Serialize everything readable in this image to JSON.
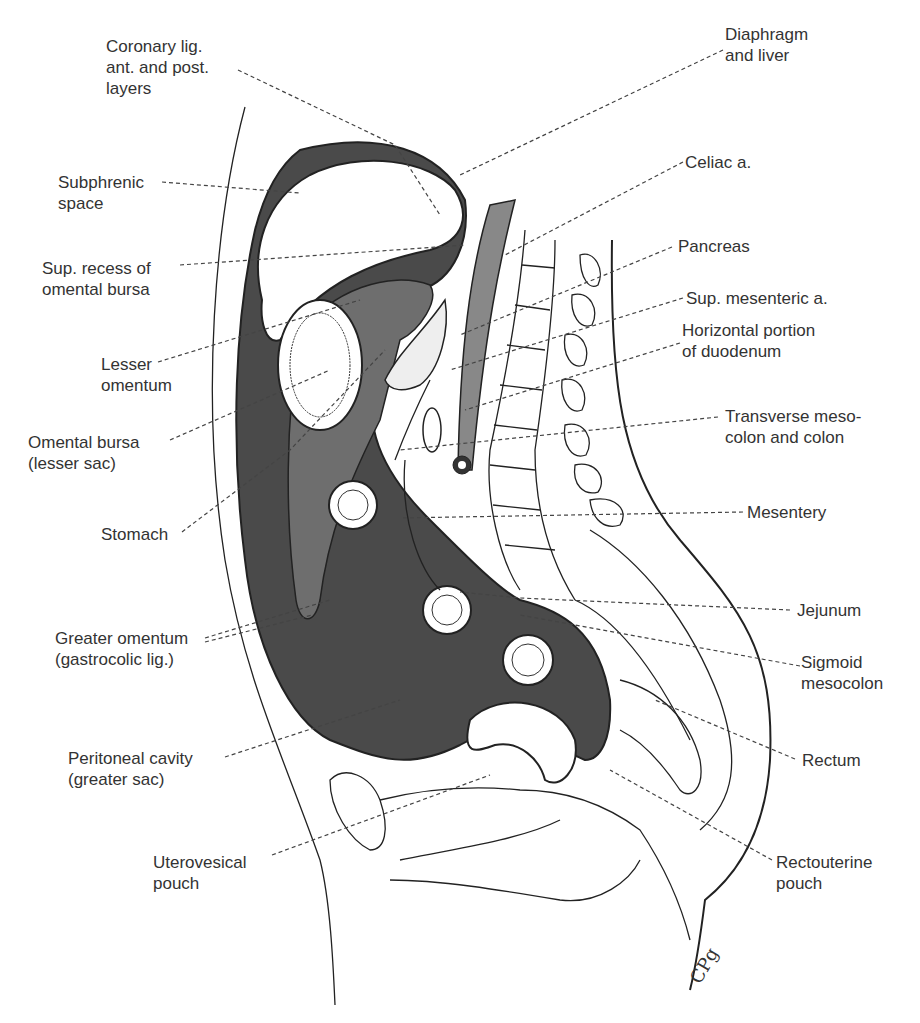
{
  "figure": {
    "signature": "CPg",
    "colors": {
      "peritoneal_cavity": "#4a4a4a",
      "omental_bursa": "#6e6e6e",
      "outline": "#222222",
      "background": "#ffffff"
    }
  },
  "labels": {
    "left": [
      {
        "id": "coronary-lig",
        "text": "Coronary lig.\nant. and post.\nlayers"
      },
      {
        "id": "subphrenic-space",
        "text": "Subphrenic\nspace"
      },
      {
        "id": "sup-recess",
        "text": "Sup. recess of\nomental bursa"
      },
      {
        "id": "lesser-omentum",
        "text": "Lesser\nomentum"
      },
      {
        "id": "omental-bursa",
        "text": "Omental bursa\n(lesser sac)"
      },
      {
        "id": "stomach",
        "text": "Stomach"
      },
      {
        "id": "greater-omentum",
        "text": "Greater omentum\n(gastrocolic lig.)"
      },
      {
        "id": "peritoneal-cavity",
        "text": "Peritoneal cavity\n(greater sac)"
      },
      {
        "id": "uterovesical-pouch",
        "text": "Uterovesical\npouch"
      }
    ],
    "right": [
      {
        "id": "diaphragm-liver",
        "text": "Diaphragm\nand liver"
      },
      {
        "id": "celiac-a",
        "text": "Celiac a."
      },
      {
        "id": "pancreas",
        "text": "Pancreas"
      },
      {
        "id": "sup-mesenteric-a",
        "text": "Sup. mesenteric a."
      },
      {
        "id": "horizontal-duodenum",
        "text": "Horizontal portion\nof duodenum"
      },
      {
        "id": "transverse-mesocolon",
        "text": "Transverse meso-\ncolon and colon"
      },
      {
        "id": "mesentery",
        "text": "Mesentery"
      },
      {
        "id": "jejunum",
        "text": "Jejunum"
      },
      {
        "id": "sigmoid-mesocolon",
        "text": "Sigmoid\nmesocolon"
      },
      {
        "id": "rectum",
        "text": "Rectum"
      },
      {
        "id": "rectouterine-pouch",
        "text": "Rectouterine\npouch"
      }
    ]
  }
}
